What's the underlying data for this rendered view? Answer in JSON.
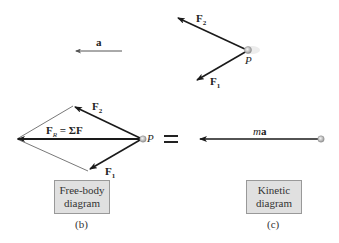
{
  "top": {
    "accel_label": "a",
    "particle_label": "P",
    "f1_label": "F",
    "f1_sub": "1",
    "f2_label": "F",
    "f2_sub": "2"
  },
  "free_body": {
    "resultant_label": "F",
    "resultant_sub": "R",
    "resultant_eq": " = ΣF",
    "particle_label": "P",
    "f1_label": "F",
    "f1_sub": "1",
    "f2_label": "F",
    "f2_sub": "2",
    "box_line1": "Free-body",
    "box_line2": "diagram",
    "caption": "(b)"
  },
  "equals": "=",
  "kinetic": {
    "ma_label_m": "m",
    "ma_label_a": "a",
    "box_line1": "Kinetic",
    "box_line2": "diagram",
    "caption": "(c)"
  },
  "colors": {
    "arrow": "#1a1a1a",
    "thin": "#555555",
    "box_bg": "#e0e0e0",
    "particle": "#bbbbbb"
  }
}
